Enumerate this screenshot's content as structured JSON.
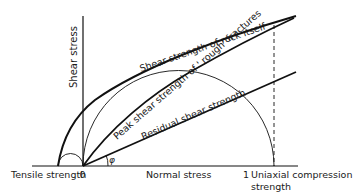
{
  "diagram": {
    "axes": {
      "y_label": "Shear stress",
      "x_label": "Normal stress",
      "origin_label": "0",
      "tensile_label": "Tensile strength",
      "ucs_tick_label": "1",
      "ucs_label_line1": "Uniaxial compression",
      "ucs_label_line2": "strength"
    },
    "curves": {
      "intact_rock": "Shear strength of rock itself",
      "peak_fractures": "Peak shear strength of ' rough' fractures",
      "residual": "Residual shear strength"
    },
    "angle_symbol": "φ",
    "colors": {
      "line": "#111111",
      "background": "#ffffff"
    }
  }
}
